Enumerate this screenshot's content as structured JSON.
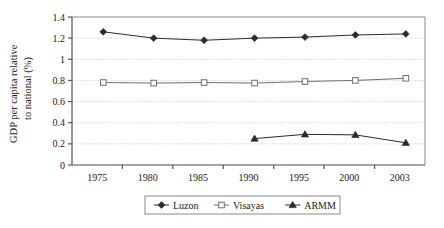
{
  "chart_data": {
    "type": "line",
    "title": "",
    "xlabel": "",
    "ylabel": "GDP per capita relative to national (%)",
    "ylabel_line1": "GDP per capita relative",
    "ylabel_line2": "to national (%)",
    "categories": [
      "1975",
      "1980",
      "1985",
      "1990",
      "1995",
      "2000",
      "2003"
    ],
    "ylim": [
      0,
      1.4
    ],
    "ytick_labels": [
      "1.4",
      "1.2",
      "1",
      "0.8",
      "0.6",
      "0.4",
      "0.2",
      "0"
    ],
    "ytick_values": [
      1.4,
      1.2,
      1,
      0.8,
      0.6,
      0.4,
      0.2,
      0
    ],
    "grid": true,
    "grid_style": "dotted-horizontal",
    "legend_position": "bottom",
    "series": [
      {
        "name": "Luzon",
        "marker": "filled-diamond",
        "color": "#2b2b2b",
        "values": [
          1.26,
          1.2,
          1.18,
          1.2,
          1.21,
          1.23,
          1.24
        ]
      },
      {
        "name": "Visayas",
        "marker": "open-square",
        "color": "#6e6e6e",
        "values": [
          0.78,
          0.775,
          0.78,
          0.775,
          0.79,
          0.8,
          0.82
        ]
      },
      {
        "name": "ARMM",
        "marker": "filled-triangle",
        "color": "#2b2b2b",
        "values": [
          null,
          null,
          null,
          0.25,
          0.29,
          0.285,
          0.21
        ]
      }
    ]
  },
  "colors": {
    "axis": "#555555",
    "grid": "#bdbdbd",
    "plot_border": "#8a8a8a",
    "text": "#1a1a1a",
    "legend_border": "#8a8a8a",
    "background": "#ffffff"
  }
}
